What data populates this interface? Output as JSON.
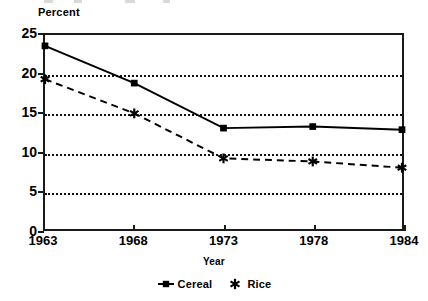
{
  "chart_data": {
    "type": "line",
    "title": "",
    "xlabel": "Year",
    "ylabel": "Percent",
    "categories": [
      "1963",
      "1968",
      "1973",
      "1978",
      "1984"
    ],
    "ylim": [
      0,
      25
    ],
    "yticks": [
      0,
      5,
      10,
      15,
      20,
      25
    ],
    "ytick_labels": [
      "0",
      "5",
      "10",
      "15",
      "20",
      "25"
    ],
    "gridlines": [
      5,
      10,
      15,
      20
    ],
    "grid": true,
    "legend_position": "bottom-center",
    "series": [
      {
        "name": "Cereal",
        "values": [
          23.6,
          18.8,
          13.0,
          13.2,
          12.8
        ],
        "line_style": "solid",
        "marker": "square",
        "color": "#000000"
      },
      {
        "name": "Rice",
        "values": [
          19.3,
          14.9,
          9.1,
          8.7,
          7.9
        ],
        "line_style": "dashed",
        "marker": "asterisk",
        "color": "#000000"
      }
    ]
  },
  "axes": {
    "y_title": "Percent",
    "x_title": "Year"
  },
  "legend": {
    "items": [
      {
        "label": "Cereal",
        "marker": "square-marker-icon"
      },
      {
        "label": "Rice",
        "marker": "asterisk-marker-icon"
      }
    ]
  },
  "colors": {
    "ink": "#000000",
    "frame": "#1a1a1a",
    "background": "#ffffff"
  }
}
